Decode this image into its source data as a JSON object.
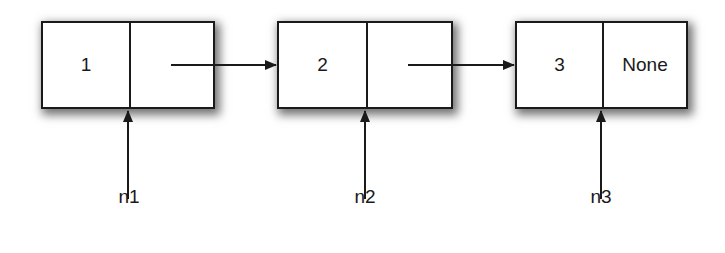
{
  "diagram": {
    "type": "linked-list",
    "nodes": [
      {
        "id": "node-1",
        "data": "1",
        "next": ""
      },
      {
        "id": "node-2",
        "data": "2",
        "next": ""
      },
      {
        "id": "node-3",
        "data": "3",
        "next": "None"
      }
    ],
    "pointers": [
      {
        "label": "n1",
        "target": "node-1"
      },
      {
        "label": "n2",
        "target": "node-2"
      },
      {
        "label": "n3",
        "target": "node-3"
      }
    ],
    "edges": [
      {
        "from": "node-1.next",
        "to": "node-2"
      },
      {
        "from": "node-2.next",
        "to": "node-3"
      }
    ],
    "colors": {
      "stroke": "#1a1a1a",
      "fill": "#ffffff"
    }
  }
}
